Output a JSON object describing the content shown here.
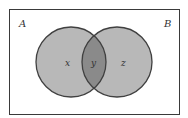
{
  "diagram": {
    "type": "venn",
    "universe": {
      "left_label": "A",
      "right_label": "B"
    },
    "sets": [
      {
        "region": "left-only",
        "label": "x"
      },
      {
        "region": "intersection",
        "label": "y"
      },
      {
        "region": "right-only",
        "label": "z"
      }
    ],
    "colors": {
      "background": "#ffffff",
      "border": "#3a3a3a",
      "circle_fill": "#b8b8b8",
      "intersection_fill": "#8a8a8a",
      "circle_stroke": "#404040"
    }
  }
}
